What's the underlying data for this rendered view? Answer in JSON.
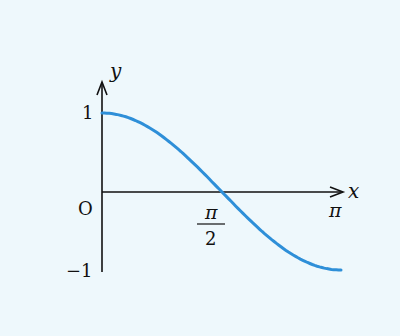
{
  "chart_data": {
    "type": "line",
    "title": "",
    "function": "y = cos(x)",
    "xlabel": "x",
    "ylabel": "y",
    "x_ticks": [
      {
        "value": 0,
        "label": "O"
      },
      {
        "value": 1.5708,
        "label_num": "π",
        "label_den": "2"
      },
      {
        "value": 3.1416,
        "label": "π"
      }
    ],
    "y_ticks": [
      {
        "value": 1,
        "label": "1"
      },
      {
        "value": -1,
        "label": "−1"
      }
    ],
    "xlim": [
      0,
      3.1416
    ],
    "ylim": [
      -1,
      1
    ],
    "grid": false,
    "legend": null,
    "series": [
      {
        "name": "cos x",
        "color": "#2e8fd8",
        "x": [
          0,
          0.3927,
          0.7854,
          1.1781,
          1.5708,
          1.9635,
          2.3562,
          2.7489,
          3.1416
        ],
        "y": [
          1,
          0.924,
          0.707,
          0.383,
          0,
          -0.383,
          -0.707,
          -0.924,
          -1
        ]
      }
    ]
  },
  "labels": {
    "y_axis": "y",
    "x_axis": "x",
    "origin": "O",
    "y_one": "1",
    "y_minus_one": "−1",
    "pi_half_num": "π",
    "pi_half_den": "2",
    "pi": "π"
  },
  "colors": {
    "background": "#eef8fc",
    "curve": "#2e8fd8",
    "axis": "#111111"
  }
}
